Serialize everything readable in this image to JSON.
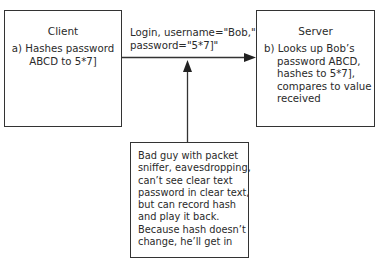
{
  "client": {
    "title": "Client",
    "lines": [
      "a) Hashes password",
      "ABCD to 5*7]"
    ]
  },
  "server": {
    "title": "Server",
    "lines": [
      "b) Looks up Bob’s",
      "password ABCD,",
      "hashes to 5*7],",
      "compares to value",
      "received"
    ]
  },
  "message": {
    "lines": [
      "Login, username=\"Bob,\"",
      "password=\"5*7]\""
    ]
  },
  "attacker": {
    "lines": [
      "Bad guy with packet",
      "sniffer, eavesdropping,",
      "can’t see clear text",
      "password in clear text,",
      "but can record hash",
      "and play it back.",
      "Because hash doesn’t",
      "change, he’ll get in"
    ]
  }
}
